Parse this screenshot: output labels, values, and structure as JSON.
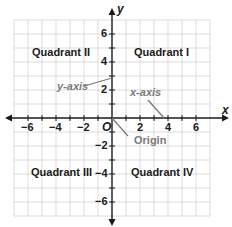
{
  "diagram": {
    "axes": {
      "x_label": "x",
      "y_label": "y",
      "origin_label": "O",
      "x_ticks": [
        "−6",
        "−4",
        "−2",
        "2",
        "4",
        "6"
      ],
      "y_ticks_positive": [
        "6",
        "4",
        "2"
      ],
      "y_ticks_negative": [
        "−2",
        "−4",
        "−6"
      ]
    },
    "quadrants": {
      "q1": "Quadrant I",
      "q2": "Quadrant II",
      "q3": "Quadrant III",
      "q4": "Quadrant IV"
    },
    "annotations": {
      "y_axis": "y-axis",
      "x_axis": "x-axis",
      "origin": "Origin"
    },
    "colors": {
      "grid": "#d4d4d4",
      "axis": "#1a1a1a",
      "annotation": "#7a7a7a",
      "text": "#1a1a1a"
    },
    "grid_range": {
      "min": -7,
      "max": 7
    }
  }
}
